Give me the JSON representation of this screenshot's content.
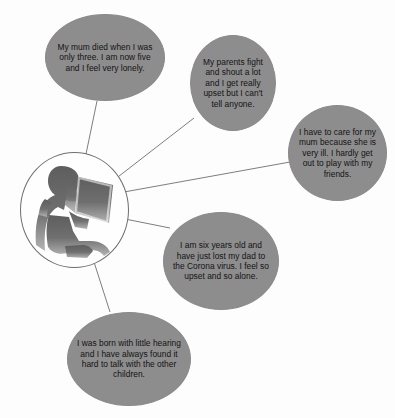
{
  "diagram": {
    "background_color": "#fdfdfd",
    "node_fill_color": "#8d8d8d",
    "node_text_color": "#131313",
    "connector_color": "#6f6f6f",
    "center": {
      "label": "child-reading-silhouette",
      "description": "Grayscale silhouette of a child sitting and reading an open book",
      "silhouette_color": "#6e6e6e"
    },
    "nodes": [
      {
        "id": "node-1",
        "name": "quote-bereaved-mum",
        "text": "My mum died when I was only three. I am now five and I feel very lonely."
      },
      {
        "id": "node-2",
        "name": "quote-parents-fighting",
        "text": "My parents fight and shout a lot and I get really upset but I can't tell anyone."
      },
      {
        "id": "node-3",
        "name": "quote-young-carer",
        "text": "I have to care for my mum because she is very ill. I hardly get out to play with my friends."
      },
      {
        "id": "node-4",
        "name": "quote-bereaved-dad-corona",
        "text": "I am six years old and have just lost my dad to the Corona virus. I feel so upset and so alone."
      },
      {
        "id": "node-5",
        "name": "quote-hearing-impairment",
        "text": "I was born with little hearing and I have always found it hard to talk with the other children."
      }
    ]
  }
}
